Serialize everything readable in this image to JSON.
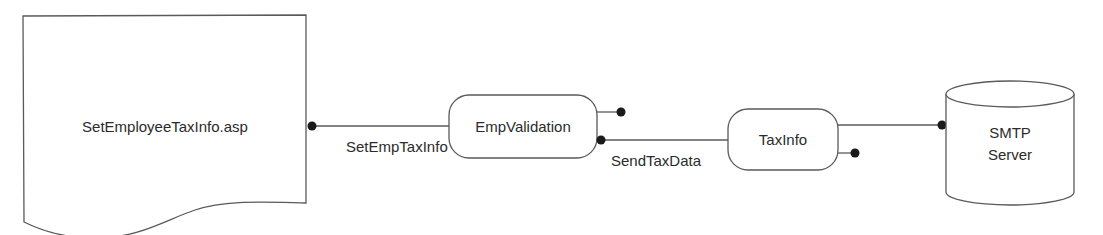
{
  "diagram": {
    "nodes": {
      "document": {
        "label": "SetEmployeeTaxInfo.asp",
        "shape": "document"
      },
      "emp_validation": {
        "label": "EmpValidation",
        "shape": "rounded-rect"
      },
      "tax_info": {
        "label": "TaxInfo",
        "shape": "rounded-rect"
      },
      "smtp": {
        "line1": "SMTP",
        "line2": "Server",
        "shape": "cylinder"
      }
    },
    "edges": {
      "doc_to_empvalidation": {
        "label": "SetEmpTaxInfo"
      },
      "empvalidation_to_taxinfo": {
        "label": "SendTaxData"
      },
      "taxinfo_to_smtp": {
        "label": ""
      }
    },
    "colors": {
      "stroke": "#5a5a5a",
      "dot": "#1a1a1a",
      "text": "#2b2b2b",
      "background": "#ffffff"
    }
  }
}
